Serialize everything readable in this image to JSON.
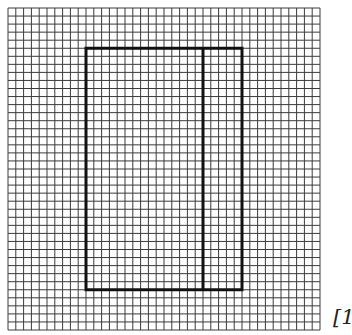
{
  "diagram": {
    "type": "grid-with-rectangle",
    "grid": {
      "columns": 40,
      "rows": 40,
      "origin_x": 8,
      "origin_y": 8,
      "cell_width": 7.8,
      "cell_height": 8.05,
      "line_color": "#3a3a3a",
      "line_width": 1
    },
    "rectangle": {
      "col_start": 10,
      "col_end": 30,
      "row_start": 5,
      "row_end": 35,
      "line_color": "#111111",
      "line_width": 3
    },
    "divider": {
      "col": 25,
      "row_start": 5,
      "row_end": 35
    }
  },
  "label": {
    "text": "[1"
  }
}
